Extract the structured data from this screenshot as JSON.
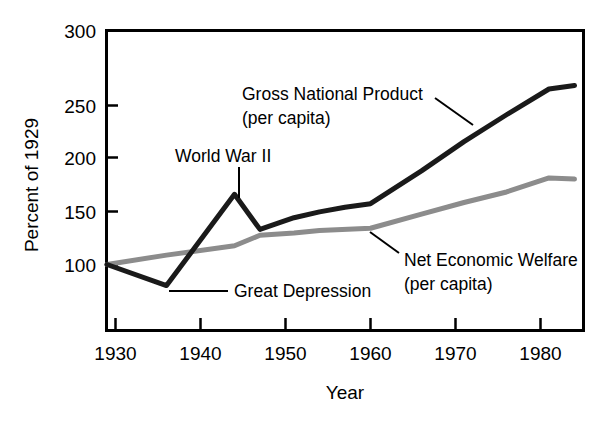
{
  "chart_data": {
    "type": "line",
    "title": "",
    "xlabel": "Year",
    "ylabel": "Percent of 1929",
    "xlim": [
      1929,
      1984
    ],
    "ylim": [
      70,
      300
    ],
    "xticks": [
      1930,
      1940,
      1950,
      1960,
      1970,
      1980
    ],
    "xticklabels": [
      "1930",
      "1940",
      "1950",
      "1960",
      "1970",
      "1980"
    ],
    "yticks": [
      100,
      150,
      200,
      250,
      300
    ],
    "yticklabels": [
      "100",
      "150",
      "200",
      "250",
      "300"
    ],
    "grid": false,
    "legend": "none (inline annotations)",
    "series": [
      {
        "name": "Gross National Product (per capita)",
        "color": "#1a1a1a",
        "x": [
          1929,
          1936,
          1944,
          1947,
          1951,
          1954,
          1957,
          1960,
          1966,
          1971,
          1976,
          1981,
          1984
        ],
        "values": [
          100,
          82,
          160,
          130,
          140,
          145,
          149,
          152,
          180,
          205,
          228,
          250,
          253
        ]
      },
      {
        "name": "Net Economic Welfare (per capita)",
        "color": "#8c8c8c",
        "x": [
          1929,
          1936,
          1944,
          1947,
          1951,
          1954,
          1960,
          1966,
          1971,
          1976,
          1981,
          1984
        ],
        "values": [
          100,
          108,
          116,
          125,
          127,
          129,
          131,
          143,
          153,
          162,
          174,
          173
        ]
      }
    ],
    "annotations": [
      {
        "id": "world-war-ii",
        "lines": [
          "World War II"
        ],
        "text_x": 1948.5,
        "text_y": 183,
        "point_x": 1944,
        "point_y": 160
      },
      {
        "id": "great-depression",
        "lines": [
          "Great Depression"
        ],
        "text_x": 1955,
        "text_y": 82,
        "point_x": 1936,
        "point_y": 82
      },
      {
        "id": "gross-national-product",
        "lines": [
          "Gross National Product",
          "(per capita)"
        ],
        "text_x": 1955,
        "text_y": 252,
        "point_x": 1974,
        "point_y": 225
      },
      {
        "id": "net-economic-welfare",
        "lines": [
          "Net Economic Welfare",
          "(per capita)"
        ],
        "text_x": 1966,
        "text_y": 112,
        "point_x": 1959,
        "point_y": 130
      }
    ]
  },
  "figure": {
    "background_color": "#ffffff",
    "axis_color": "#000000",
    "gnp_color": "#1a1a1a",
    "new_color": "#8c8c8c",
    "ylabel": "Percent of 1929",
    "xlabel": "Year",
    "ytick_labels": [
      "300",
      "250",
      "200",
      "150",
      "100"
    ],
    "xtick_labels": [
      "1930",
      "1940",
      "1950",
      "1960",
      "1970",
      "1980"
    ],
    "annot_wwii": "World War II",
    "annot_depression": "Great Depression",
    "annot_gnp_line1": "Gross National Product",
    "annot_gnp_line2": "(per capita)",
    "annot_new_line1": "Net Economic Welfare",
    "annot_new_line2": "(per capita)"
  }
}
